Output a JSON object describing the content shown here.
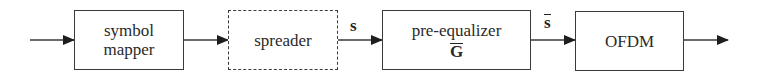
{
  "diagram": {
    "type": "block-diagram",
    "direction": "left-to-right",
    "blocks": [
      {
        "id": "symbol-mapper",
        "lines": [
          "symbol",
          "mapper"
        ],
        "border": "solid"
      },
      {
        "id": "spreader",
        "lines": [
          "spreader"
        ],
        "border": "dashed"
      },
      {
        "id": "pre-equalizer",
        "lines": [
          "pre-equalizer"
        ],
        "matrix_symbol": "G",
        "matrix_overbar": true,
        "border": "solid"
      },
      {
        "id": "ofdm",
        "lines": [
          "OFDM"
        ],
        "border": "solid"
      }
    ],
    "edges": [
      {
        "from": "input",
        "to": "symbol-mapper",
        "label": ""
      },
      {
        "from": "symbol-mapper",
        "to": "spreader",
        "label": ""
      },
      {
        "from": "spreader",
        "to": "pre-equalizer",
        "label": "s",
        "label_style": "bold"
      },
      {
        "from": "pre-equalizer",
        "to": "ofdm",
        "label": "s",
        "label_style": "bold-overbar"
      },
      {
        "from": "ofdm",
        "to": "output",
        "label": ""
      }
    ],
    "colors": {
      "line": "#3a3a3a",
      "text": "#2a2a2a",
      "background": "#ffffff"
    }
  }
}
